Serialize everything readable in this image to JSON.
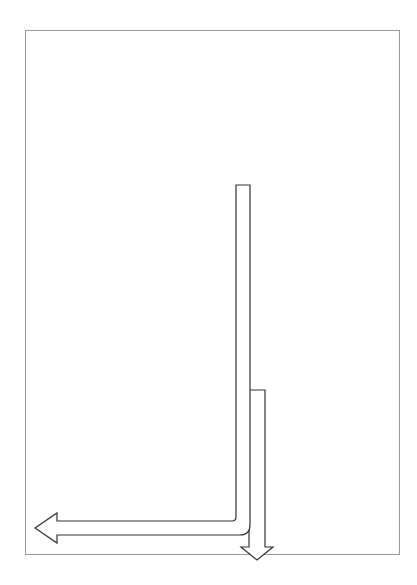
{
  "phase2": {
    "title_line1": "Phase 2 -",
    "title_line2": "Ongoing",
    "desc_lines": [
      "Ongoing",
      "process",
      "performed",
      "by the",
      "CMT until",
      "incident",
      "is resolved"
    ]
  },
  "phase1": {
    "title": "Phase 1 - Done only once",
    "desc1_lines": [
      "Activation steps performed",
      "by the Incident Assessment",
      "Team (IAT)"
    ],
    "desc2_lines": [
      "Once completed, the team",
      "spends its  time in the",
      "planning cycle (above)",
      "of the Planning P"
    ]
  },
  "cycle": {
    "top_row": [
      {
        "lines": [
          "Exec., CMT & DOC",
          "Detailed briefing"
        ]
      },
      {
        "lines": [
          "Execute plan (IAP)"
        ]
      },
      {
        "lines": [
          "Receive feedback &",
          "status from teams"
        ]
      }
    ],
    "bottom_row": [
      {
        "lines": [
          "Develop Objectives,",
          "the IAP & set the",
          "Operational Period"
        ]
      },
      {
        "lines": [
          "Prepare for next IAP",
          "meeting - pull together",
          "new status & objectives"
        ]
      },
      {
        "lines": [
          "Ongoing",
          "Assessment"
        ]
      }
    ]
  },
  "activation_steps": [
    {
      "lines": [
        "Executive, CMT &",
        "DOC initial briefing"
      ]
    },
    {
      "lines": [
        "Executive, CMT &",
        "DOC notifications"
      ]
    },
    {
      "lines": [
        "Call the question -",
        "Avtivate?"
      ]
    },
    {
      "lines": [
        "Situational Awareness",
        "& Assessment"
      ]
    },
    {
      "lines": [
        "IAT notification"
      ]
    },
    {
      "lines": [
        "Incident"
      ]
    }
  ],
  "colors": {
    "box_fill": "#e2e2e2",
    "frame_border": "#9a9a9a",
    "arrow_stroke": "#333333",
    "text": "#555555"
  }
}
